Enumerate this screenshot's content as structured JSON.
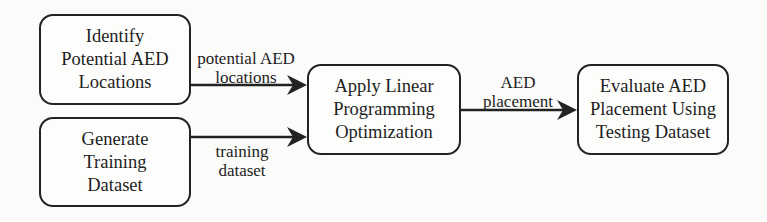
{
  "diagram": {
    "type": "flowchart",
    "nodes": [
      {
        "id": "identify",
        "label": "Identify\nPotential AED\nLocations"
      },
      {
        "id": "generate",
        "label": "Generate\nTraining\nDataset"
      },
      {
        "id": "apply",
        "label": "Apply Linear\nProgramming\nOptimization"
      },
      {
        "id": "evaluate",
        "label": "Evaluate AED\nPlacement Using\nTesting Dataset"
      }
    ],
    "edges": [
      {
        "from": "identify",
        "to": "apply",
        "label": "potential AED\nlocations"
      },
      {
        "from": "generate",
        "to": "apply",
        "label": "training\ndataset"
      },
      {
        "from": "apply",
        "to": "evaluate",
        "label": "AED\nplacement"
      }
    ]
  },
  "colors": {
    "stroke": "#222222",
    "background": "#fbfbfa",
    "text": "#1d1d1d"
  }
}
